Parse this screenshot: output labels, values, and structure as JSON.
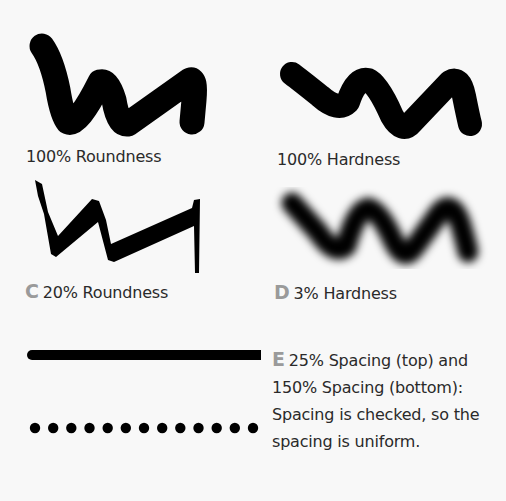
{
  "figure": {
    "panels": [
      {
        "id": "A",
        "marker": "",
        "caption": "100% Roundness",
        "brush": "round-hard"
      },
      {
        "id": "B",
        "marker": "",
        "caption": "100% Hardness",
        "brush": "round-hard"
      },
      {
        "id": "C",
        "marker": "C",
        "caption": "20% Roundness",
        "brush": "flat-calligraphic"
      },
      {
        "id": "D",
        "marker": "D",
        "caption": "3% Hardness",
        "brush": "round-soft"
      }
    ],
    "spacing": {
      "marker": "E",
      "lines": [
        "25% Spacing (top) and",
        "150% Spacing (bottom):",
        "Spacing is checked, so the",
        "spacing is uniform."
      ],
      "dot_count": 13
    },
    "colors": {
      "ink": "#000000",
      "marker": "#9a9a9a",
      "text": "#2a2a2a",
      "background": "#f8f8f8"
    }
  }
}
